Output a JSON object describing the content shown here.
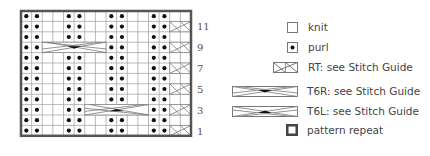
{
  "chart": {
    "columns": 16,
    "rows": 12,
    "grid": {
      "left": 21,
      "top": 11,
      "cell_w": 10.625,
      "cell_h": 10.4
    },
    "border_color": "#555555",
    "line_color": "#a8a8a8",
    "row_numbers": [
      {
        "row": 11,
        "label": "11"
      },
      {
        "row": 9,
        "label": "9"
      },
      {
        "row": 7,
        "label": "7"
      },
      {
        "row": 5,
        "label": "5"
      },
      {
        "row": 3,
        "label": "3"
      },
      {
        "row": 1,
        "label": "1"
      }
    ],
    "purl_columns": [
      1,
      2,
      5,
      6,
      9,
      10,
      13,
      14
    ],
    "cables": [
      {
        "type": "RT",
        "row": 11,
        "col_start": 15,
        "width": 2
      },
      {
        "type": "RT",
        "row": 9,
        "col_start": 15,
        "width": 2
      },
      {
        "type": "RT",
        "row": 7,
        "col_start": 15,
        "width": 2
      },
      {
        "type": "RT",
        "row": 5,
        "col_start": 15,
        "width": 2
      },
      {
        "type": "RT",
        "row": 3,
        "col_start": 15,
        "width": 2
      },
      {
        "type": "RT",
        "row": 1,
        "col_start": 15,
        "width": 2
      },
      {
        "type": "T6R",
        "row": 9,
        "col_start": 3,
        "width": 6
      },
      {
        "type": "T6L",
        "row": 3,
        "col_start": 7,
        "width": 6
      }
    ]
  },
  "legend": {
    "knit": "knit",
    "purl": "purl",
    "rt": "RT: see Stitch Guide",
    "t6r": "T6R: see Stitch Guide",
    "t6l": "T6L: see Stitch Guide",
    "repeat": "pattern repeat"
  },
  "labels": {
    "r11": "11",
    "r9": "9",
    "r7": "7",
    "r5": "5",
    "r3": "3",
    "r1": "1"
  }
}
